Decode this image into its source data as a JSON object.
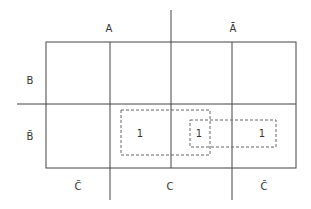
{
  "diagram": {
    "type": "karnaugh-map",
    "column_labels": {
      "top": [
        "A",
        "Ā"
      ],
      "bottom": [
        "C̄",
        "C",
        "C̄"
      ]
    },
    "row_labels": [
      "B",
      "B̄"
    ],
    "cells": [
      [
        "",
        "",
        "",
        ""
      ],
      [
        "",
        "1",
        "1",
        "1"
      ]
    ],
    "groups": [
      {
        "name": "group-1",
        "cells": "B̄ row, columns 2-3"
      },
      {
        "name": "group-2",
        "cells": "B̄ row, columns 3-4"
      }
    ]
  }
}
